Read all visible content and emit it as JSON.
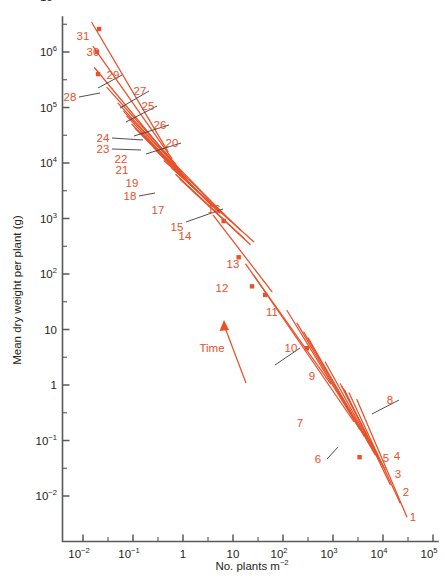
{
  "figure": {
    "background_color": "#ffffff",
    "series_color": "#e8512a",
    "axis_color": "#58595b",
    "text_color": "#231f20"
  },
  "chart_data": {
    "type": "line",
    "title": "",
    "subtitle": "",
    "xlabel": "No. plants m",
    "xlabel_sup": "−2",
    "ylabel": "Mean dry weight per plant (g)",
    "xscale": "log",
    "yscale": "log",
    "xlim": [
      0.01,
      100000
    ],
    "ylim": [
      0.01,
      10000000
    ],
    "grid": false,
    "legend": "none",
    "x_tick_labels": [
      {
        "base": "10",
        "sup": "−2",
        "value": 0.01
      },
      {
        "base": "10",
        "sup": "−1",
        "value": 0.1
      },
      {
        "base": "1",
        "sup": "",
        "value": 1
      },
      {
        "base": "10",
        "sup": "",
        "value": 10
      },
      {
        "base": "10",
        "sup": "2",
        "value": 100
      },
      {
        "base": "10",
        "sup": "3",
        "value": 1000
      },
      {
        "base": "10",
        "sup": "4",
        "value": 10000
      },
      {
        "base": "10",
        "sup": "5",
        "value": 100000
      }
    ],
    "y_tick_labels": [
      {
        "base": "10",
        "sup": "−2",
        "value": 0.01
      },
      {
        "base": "10",
        "sup": "−1",
        "value": 0.1
      },
      {
        "base": "1",
        "sup": "",
        "value": 1
      },
      {
        "base": "10",
        "sup": "",
        "value": 10
      },
      {
        "base": "10",
        "sup": "2",
        "value": 100
      },
      {
        "base": "10",
        "sup": "3",
        "value": 1000
      },
      {
        "base": "10",
        "sup": "4",
        "value": 10000
      },
      {
        "base": "10",
        "sup": "5",
        "value": 100000
      },
      {
        "base": "10",
        "sup": "6",
        "value": 1000000
      },
      {
        "base": "10",
        "sup": "7",
        "value": 10000000
      }
    ],
    "annotations": [
      {
        "text": "Time",
        "x_px": 212,
        "y_px": 352,
        "kind": "direction-label"
      }
    ],
    "series": [
      {
        "name": "1",
        "x": [
          3000,
          30000
        ],
        "y": [
          0.55,
          0.0042
        ],
        "label_x_px": 413,
        "label_y_px": 521,
        "leader": false,
        "marker": null
      },
      {
        "name": "2",
        "x": [
          2100,
          22000
        ],
        "y": [
          0.72,
          0.0075
        ],
        "label_x_px": 406,
        "label_y_px": 496,
        "leader": false,
        "marker": {
          "x": 3400,
          "y": 0.05
        }
      },
      {
        "name": "3",
        "x": [
          1700,
          14000
        ],
        "y": [
          0.82,
          0.016
        ],
        "label_x_px": 398,
        "label_y_px": 478,
        "leader": false,
        "marker": null
      },
      {
        "name": "4",
        "x": [
          1500,
          11000
        ],
        "y": [
          0.95,
          0.03
        ],
        "label_x_px": 397,
        "label_y_px": 460,
        "leader": false,
        "marker": null
      },
      {
        "name": "5",
        "x": [
          1400,
          10000
        ],
        "y": [
          1.05,
          0.034
        ],
        "label_x_px": 386,
        "label_y_px": 462,
        "leader": false,
        "marker": null
      },
      {
        "name": "6",
        "x": [
          700,
          9000
        ],
        "y": [
          2.6,
          0.04
        ],
        "label_x_px": 318,
        "label_y_px": 463,
        "leader": true,
        "leader_to_px": [
          338,
          447
        ],
        "marker": null
      },
      {
        "name": "7",
        "x": [
          320,
          7000
        ],
        "y": [
          7.0,
          0.055
        ],
        "label_x_px": 300,
        "label_y_px": 427,
        "leader": false,
        "marker": null
      },
      {
        "name": "8",
        "x": [
          260,
          6000
        ],
        "y": [
          9.0,
          0.075
        ],
        "label_x_px": 390,
        "label_y_px": 404,
        "leader": true,
        "leader_to_px": [
          372,
          414
        ],
        "marker": null
      },
      {
        "name": "9",
        "x": [
          190,
          4200
        ],
        "y": [
          13.0,
          0.12
        ],
        "label_x_px": 312,
        "label_y_px": 380,
        "leader": false,
        "marker": {
          "x": 300,
          "y": 4.6
        }
      },
      {
        "name": "10",
        "x": [
          120,
          3400
        ],
        "y": [
          22.0,
          0.16
        ],
        "label_x_px": 291,
        "label_y_px": 352,
        "leader": true,
        "leader_to_px": [
          275,
          365
        ],
        "marker": null
      },
      {
        "name": "11",
        "x": [
          26,
          2600
        ],
        "y": [
          95.0,
          0.22
        ],
        "label_x_px": 272,
        "label_y_px": 316,
        "leader": false,
        "marker": {
          "x": 44,
          "y": 42
        }
      },
      {
        "name": "12",
        "x": [
          18,
          900
        ],
        "y": [
          150.0,
          1.05
        ],
        "label_x_px": 222,
        "label_y_px": 292,
        "leader": false,
        "marker": {
          "x": 24,
          "y": 60
        }
      },
      {
        "name": "13",
        "x": [
          4.0,
          60
        ],
        "y": [
          1150.0,
          48.0
        ],
        "label_x_px": 233,
        "label_y_px": 268,
        "leader": false,
        "marker": {
          "x": 13,
          "y": 200
        }
      },
      {
        "name": "14",
        "x": [
          0.85,
          22
        ],
        "y": [
          5200.0,
          340.0
        ],
        "label_x_px": 185,
        "label_y_px": 240,
        "leader": false,
        "marker": {
          "x": 6.5,
          "y": 900
        }
      },
      {
        "name": "15",
        "x": [
          0.72,
          17
        ],
        "y": [
          6200.0,
          430.0
        ],
        "label_x_px": 177,
        "label_y_px": 231,
        "leader": false,
        "marker": null
      },
      {
        "name": "16",
        "x": [
          0.6,
          26
        ],
        "y": [
          8000.0,
          380.0
        ],
        "label_x_px": 214,
        "label_y_px": 213,
        "leader": true,
        "leader_to_px": [
          186,
          222
        ],
        "marker": null
      },
      {
        "name": "17",
        "x": [
          0.42,
          9.0
        ],
        "y": [
          11000.0,
          900.0
        ],
        "label_x_px": 158,
        "label_y_px": 214,
        "leader": false,
        "marker": null
      },
      {
        "name": "18",
        "x": [
          0.3,
          5.5
        ],
        "y": [
          16000.0,
          1250.0
        ],
        "label_x_px": 130,
        "label_y_px": 200,
        "leader": true,
        "leader_to_px": [
          155,
          193
        ],
        "marker": null
      },
      {
        "name": "19",
        "x": [
          0.26,
          4.0
        ],
        "y": [
          19000.0,
          1600.0
        ],
        "label_x_px": 132,
        "label_y_px": 187,
        "leader": false,
        "marker": null
      },
      {
        "name": "20",
        "x": [
          0.22,
          14.0
        ],
        "y": [
          24000.0,
          620.0
        ],
        "label_x_px": 172,
        "label_y_px": 147,
        "leader": true,
        "leader_to_px": [
          146,
          154
        ],
        "marker": null
      },
      {
        "name": "21",
        "x": [
          0.17,
          2.6
        ],
        "y": [
          30000.0,
          2400.0
        ],
        "label_x_px": 122,
        "label_y_px": 174,
        "leader": false,
        "marker": null
      },
      {
        "name": "22",
        "x": [
          0.14,
          2.0
        ],
        "y": [
          36000.0,
          3000.0
        ],
        "label_x_px": 121,
        "label_y_px": 163,
        "leader": false,
        "marker": null
      },
      {
        "name": "23",
        "x": [
          0.11,
          1.6
        ],
        "y": [
          42000.0,
          3600.0
        ],
        "label_x_px": 103,
        "label_y_px": 153,
        "leader": true,
        "leader_to_px": [
          141,
          150
        ],
        "marker": null
      },
      {
        "name": "24",
        "x": [
          0.095,
          1.35
        ],
        "y": [
          50000.0,
          4200.0
        ],
        "label_x_px": 103,
        "label_y_px": 142,
        "leader": true,
        "leader_to_px": [
          143,
          140
        ],
        "marker": null
      },
      {
        "name": "25",
        "x": [
          0.075,
          1.15
        ],
        "y": [
          70000.0,
          5200.0
        ],
        "label_x_px": 148,
        "label_y_px": 110,
        "leader": true,
        "leader_to_px": [
          126,
          122
        ],
        "marker": null
      },
      {
        "name": "26",
        "x": [
          0.065,
          5.5
        ],
        "y": [
          85000.0,
          1400.0
        ],
        "label_x_px": 160,
        "label_y_px": 129,
        "leader": true,
        "leader_to_px": [
          134,
          136
        ],
        "marker": null
      },
      {
        "name": "27",
        "x": [
          0.05,
          0.95
        ],
        "y": [
          120000.0,
          6800.0
        ],
        "label_x_px": 140,
        "label_y_px": 95,
        "leader": true,
        "leader_to_px": [
          120,
          108
        ],
        "marker": null
      },
      {
        "name": "28",
        "x": [
          0.017,
          0.8
        ],
        "y": [
          520000.0,
          8000.0
        ],
        "label_x_px": 70,
        "label_y_px": 101,
        "leader": true,
        "leader_to_px": [
          100,
          93
        ],
        "marker": {
          "x": 0.02,
          "y": 400000
        }
      },
      {
        "name": "29",
        "x": [
          0.03,
          0.72
        ],
        "y": [
          230000.0,
          9500.0
        ],
        "label_x_px": 113,
        "label_y_px": 79,
        "leader": true,
        "leader_to_px": [
          98,
          88
        ],
        "marker": null
      },
      {
        "name": "30",
        "x": [
          0.016,
          0.6
        ],
        "y": [
          1250000.0,
          12000.0
        ],
        "label_x_px": 93,
        "label_y_px": 56,
        "leader": false,
        "marker": {
          "x": 0.019,
          "y": 1000000
        }
      },
      {
        "name": "31",
        "x": [
          0.015,
          0.5
        ],
        "y": [
          3400000.0,
          16000.0
        ],
        "label_x_px": 83,
        "label_y_px": 40,
        "leader": false,
        "marker": {
          "x": 0.021,
          "y": 2600000
        }
      }
    ]
  }
}
